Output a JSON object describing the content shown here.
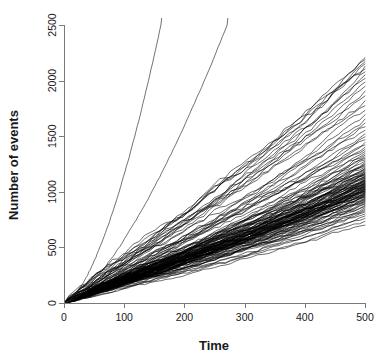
{
  "chart_data": {
    "type": "line",
    "title": "",
    "subtitle": "",
    "xlabel": "Time",
    "ylabel": "Number of events",
    "xlim": [
      0,
      500
    ],
    "ylim": [
      0,
      2500
    ],
    "grid": false,
    "legend": false,
    "legend_position": "none",
    "x_ticks": [
      0,
      100,
      200,
      300,
      400,
      500
    ],
    "x_tick_labels": [
      "0",
      "100",
      "200",
      "300",
      "400",
      "500"
    ],
    "y_ticks": [
      0,
      500,
      1000,
      1500,
      2000,
      2500
    ],
    "y_tick_labels": [
      "0",
      "500",
      "1000",
      "1500",
      "2000",
      "2500"
    ],
    "line_color": "#000000",
    "background_color": "#ffffff",
    "axis_color": "#7a7a7a",
    "n_series": 122,
    "common_start": {
      "x": 0,
      "y": 0
    },
    "series_summary": {
      "linear_bundle_count": 120,
      "linear_bundle_endpoint_x": 500,
      "linear_bundle_endpoint_y_min": 700,
      "linear_bundle_endpoint_y_max": 2200,
      "linear_bundle_dense_band_y": [
        900,
        1250
      ],
      "steep_count": 2,
      "steep_exit_top_x": [
        161,
        271
      ],
      "steep_exit_top_y": 2500
    },
    "series": [
      {
        "name": "steep-1",
        "kind": "superlinear",
        "exit_x": 161,
        "exit_y": 2500,
        "curvature": 1.62
      },
      {
        "name": "steep-2",
        "kind": "superlinear",
        "exit_x": 271,
        "exit_y": 2500,
        "curvature": 1.48
      },
      {
        "name": "bundle",
        "kind": "linear-fan",
        "count": 120,
        "slope_min": 1.4,
        "slope_max": 4.4,
        "slope_mode": 2.15,
        "jitter_amplitude": 14,
        "final_values": [
          700,
          735,
          760,
          782,
          800,
          818,
          832,
          845,
          858,
          868,
          878,
          888,
          896,
          904,
          911,
          918,
          924,
          930,
          936,
          942,
          948,
          953,
          958,
          963,
          968,
          972,
          977,
          981,
          985,
          989,
          993,
          997,
          1001,
          1005,
          1008,
          1012,
          1016,
          1019,
          1023,
          1026,
          1030,
          1033,
          1037,
          1040,
          1044,
          1047,
          1051,
          1054,
          1058,
          1061,
          1065,
          1068,
          1072,
          1076,
          1079,
          1083,
          1087,
          1091,
          1095,
          1099,
          1103,
          1107,
          1111,
          1116,
          1120,
          1125,
          1130,
          1135,
          1140,
          1145,
          1151,
          1157,
          1163,
          1169,
          1176,
          1183,
          1190,
          1198,
          1206,
          1214,
          1223,
          1232,
          1242,
          1252,
          1263,
          1275,
          1287,
          1300,
          1314,
          1329,
          1345,
          1362,
          1380,
          1400,
          1421,
          1444,
          1468,
          1494,
          1522,
          1552,
          1584,
          1618,
          1654,
          1692,
          1732,
          1774,
          1818,
          1862,
          1906,
          1948,
          1986,
          2020,
          2050,
          2078,
          2104,
          2128,
          2150,
          2170,
          2188,
          2205
        ]
      }
    ]
  },
  "axes": {
    "x_title": "Time",
    "y_title": "Number of events"
  }
}
